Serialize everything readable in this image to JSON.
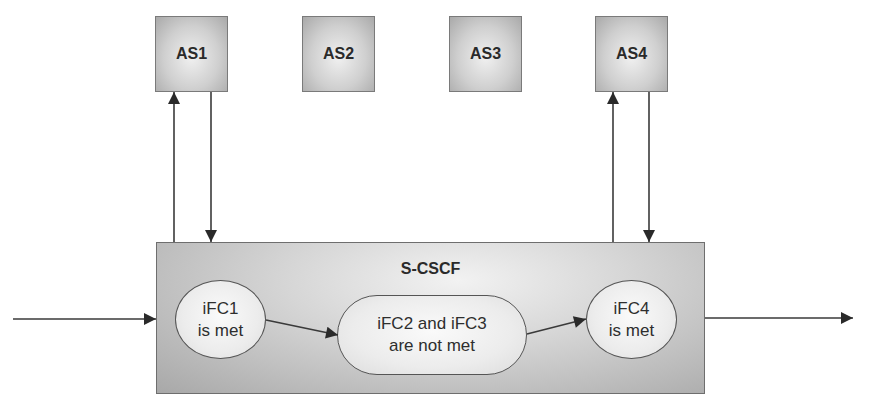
{
  "application_servers": [
    {
      "id": "as1",
      "label": "AS1",
      "x": 155
    },
    {
      "id": "as2",
      "label": "AS2",
      "x": 302
    },
    {
      "id": "as3",
      "label": "AS3",
      "x": 449
    },
    {
      "id": "as4",
      "label": "AS4",
      "x": 595
    }
  ],
  "scscf": {
    "title": "S-CSCF",
    "nodes": [
      {
        "id": "ifc1",
        "line1": "iFC1",
        "line2": "is met"
      },
      {
        "id": "ifc23",
        "line1": "iFC2 and iFC3",
        "line2": "are not  met"
      },
      {
        "id": "ifc4",
        "line1": "iFC4",
        "line2": "is met"
      }
    ]
  },
  "colors": {
    "line": "#3a3a3a",
    "box_border": "#7a7a7a"
  }
}
